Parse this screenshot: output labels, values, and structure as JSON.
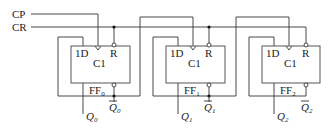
{
  "diagram": {
    "type": "circuit",
    "title": "",
    "inputs": [
      {
        "label": "CP",
        "name": "clock"
      },
      {
        "label": "CR",
        "name": "clear"
      }
    ],
    "flipflops": [
      {
        "id": "FF0",
        "name_main": "FF",
        "name_sub": "0",
        "d_label": "1D",
        "clk_label": "C1",
        "reset_label": "R",
        "q_main": "Q",
        "q_sub": "0",
        "qbar_main": "Q",
        "qbar_sub": "0"
      },
      {
        "id": "FF1",
        "name_main": "FF",
        "name_sub": "1",
        "d_label": "1D",
        "clk_label": "C1",
        "reset_label": "R",
        "q_main": "Q",
        "q_sub": "1",
        "qbar_main": "Q",
        "qbar_sub": "1"
      },
      {
        "id": "FF2",
        "name_main": "FF",
        "name_sub": "2",
        "d_label": "1D",
        "clk_label": "C1",
        "reset_label": "R",
        "q_main": "Q",
        "q_sub": "2",
        "qbar_main": "Q",
        "qbar_sub": "2"
      }
    ],
    "connections": [
      "CP -> FF0.C1",
      "CR -> FF0.R, FF1.R, FF2.R",
      "FF0.Qbar -> FF0.1D",
      "FF0.Qbar -> FF1.C1",
      "FF1.Qbar -> FF1.1D",
      "FF1.Qbar -> FF2.C1",
      "FF2.Qbar -> FF2.1D"
    ]
  }
}
